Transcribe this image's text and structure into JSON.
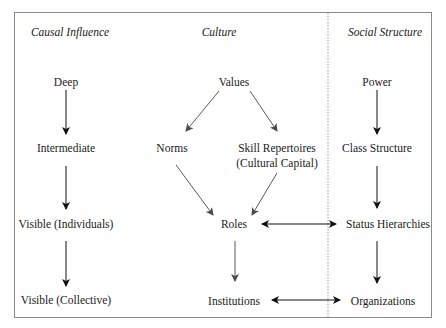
{
  "headers": {
    "causal_influence": "Causal Influence",
    "culture": "Culture",
    "social_structure": "Social Structure"
  },
  "causal_influence_levels": [
    "Deep",
    "Intermediate",
    "Visible (Individuals)",
    "Visible (Collective)"
  ],
  "culture_nodes": {
    "values": "Values",
    "norms": "Norms",
    "skill_repertoires_line1": "Skill Repertoires",
    "skill_repertoires_line2": "(Cultural Capital)",
    "roles": "Roles",
    "institutions": "Institutions"
  },
  "social_structure_nodes": [
    "Power",
    "Class Structure",
    "Status Hierarchies",
    "Organizations"
  ],
  "edges": [
    {
      "from": "Deep",
      "to": "Intermediate",
      "type": "directed"
    },
    {
      "from": "Intermediate",
      "to": "Visible (Individuals)",
      "type": "directed"
    },
    {
      "from": "Visible (Individuals)",
      "to": "Visible (Collective)",
      "type": "directed"
    },
    {
      "from": "Values",
      "to": "Norms",
      "type": "directed"
    },
    {
      "from": "Values",
      "to": "Skill Repertoires (Cultural Capital)",
      "type": "directed"
    },
    {
      "from": "Norms",
      "to": "Roles",
      "type": "directed"
    },
    {
      "from": "Skill Repertoires (Cultural Capital)",
      "to": "Roles",
      "type": "directed"
    },
    {
      "from": "Roles",
      "to": "Institutions",
      "type": "directed"
    },
    {
      "from": "Power",
      "to": "Class Structure",
      "type": "directed"
    },
    {
      "from": "Class Structure",
      "to": "Status Hierarchies",
      "type": "directed"
    },
    {
      "from": "Status Hierarchies",
      "to": "Organizations",
      "type": "directed"
    },
    {
      "from": "Roles",
      "to": "Status Hierarchies",
      "type": "bidirectional"
    },
    {
      "from": "Institutions",
      "to": "Organizations",
      "type": "bidirectional"
    }
  ],
  "colors": {
    "frame": "#8a8a8a",
    "black_arrow": "#111111",
    "gray_arrow": "#5a5a5a",
    "divider": "#9a9a9a"
  }
}
